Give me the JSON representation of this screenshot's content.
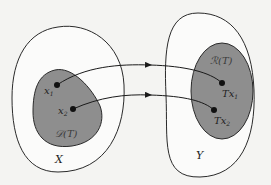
{
  "diagram": {
    "type": "set-mapping",
    "colors": {
      "background": "#f4f4f2",
      "outline": "#2a2a2a",
      "shaded_region": "#8e8e8e",
      "point": "#111111",
      "arrow": "#1a1a1a"
    },
    "sets": {
      "domain_space": {
        "label": "X"
      },
      "codomain_space": {
        "label": "Y"
      },
      "domain_region": {
        "label": "𝒟(T)"
      },
      "range_region": {
        "label": "ℛ(T)"
      }
    },
    "points": {
      "x1": {
        "label": "x",
        "sub": "1"
      },
      "x2": {
        "label": "x",
        "sub": "2"
      },
      "tx1": {
        "label": "Tx",
        "sub": "1"
      },
      "tx2": {
        "label": "Tx",
        "sub": "2"
      }
    },
    "mappings": [
      {
        "from": "x1",
        "to": "Tx1"
      },
      {
        "from": "x2",
        "to": "Tx2"
      }
    ]
  }
}
